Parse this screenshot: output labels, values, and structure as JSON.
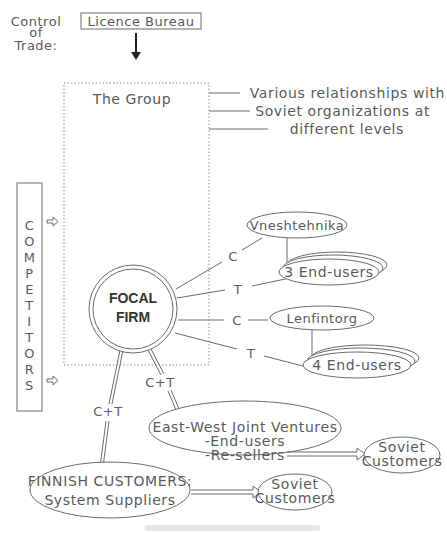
{
  "control_of_trade": {
    "label_lines": [
      "Control",
      "of",
      "Trade:"
    ],
    "licence_bureau": "Licence Bureau"
  },
  "group": {
    "title": "The Group",
    "relationships_note": [
      "Various relationships with",
      "Soviet organizations at",
      "different levels"
    ]
  },
  "competitors": {
    "letters": [
      "C",
      "O",
      "M",
      "P",
      "E",
      "T",
      "I",
      "T",
      "O",
      "R",
      "S"
    ]
  },
  "focal_firm": {
    "lines": [
      "FOCAL",
      "FIRM"
    ]
  },
  "links": {
    "c1": "C",
    "t1": "T",
    "c2": "C",
    "t2": "T",
    "ct_jv": "C+T",
    "ct_finnish": "C+T"
  },
  "nodes": {
    "vneshtehnika": "Vneshtehnika",
    "end_users_3": "3 End-users",
    "lenfintorg": "Lenfintorg",
    "end_users_4": "4 End-users",
    "joint_ventures": [
      "East-West Joint Ventures",
      "-End-users",
      "-Re-sellers"
    ],
    "soviet_customers_jv": [
      "Soviet",
      "Customers"
    ],
    "finnish_customers": [
      "FINNISH CUSTOMERS:",
      "System Suppliers"
    ],
    "soviet_customers_fin": [
      "Soviet",
      "Customers"
    ]
  },
  "colors": {
    "line": "#6a6a6a",
    "text": "#5a5a5a",
    "focal_text": "#333333",
    "background": "#ffffff"
  }
}
